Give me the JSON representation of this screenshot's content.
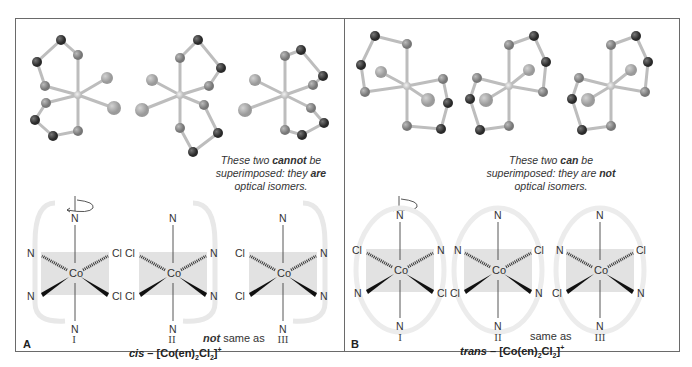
{
  "figure": {
    "panels": [
      {
        "letter": "A",
        "note_line1_pre": "These two ",
        "note_line1_bold": "cannot",
        "note_line1_post": " be",
        "note_line2_pre": "superimposed: they ",
        "note_line2_bold": "are",
        "note_line2_post": "",
        "note_line3": "optical isomers.",
        "numerals": [
          "I",
          "II",
          "III"
        ],
        "relation_bold": "not",
        "relation_text": " same as",
        "formula_prefix": "cis",
        "formula_dash": " – [Co(en)",
        "formula_sub1": "2",
        "formula_mid": "Cl",
        "formula_sub2": "2",
        "formula_end": "]",
        "formula_sup": "+",
        "structures": [
          {
            "top": "N",
            "upper_left": "N",
            "upper_right": "Cl",
            "lower_left": "N",
            "lower_right": "Cl",
            "bottom": "N",
            "center": "Co"
          },
          {
            "top": "N",
            "upper_left": "Cl",
            "upper_right": "N",
            "lower_left": "Cl",
            "lower_right": "N",
            "bottom": "N",
            "center": "Co"
          },
          {
            "top": "N",
            "upper_left": "Cl",
            "upper_right": "N",
            "lower_left": "Cl",
            "lower_right": "N",
            "bottom": "N",
            "center": "Co"
          }
        ]
      },
      {
        "letter": "B",
        "note_line1_pre": "These two ",
        "note_line1_bold": "can",
        "note_line1_post": " be",
        "note_line2_pre": "superimposed: they are ",
        "note_line2_bold": "not",
        "note_line2_post": "",
        "note_line3": "optical isomers.",
        "numerals": [
          "I",
          "II",
          "III"
        ],
        "relation_bold": "",
        "relation_text": "same as",
        "formula_prefix": "trans",
        "formula_dash": " – [Co(en)",
        "formula_sub1": "2",
        "formula_mid": "Cl",
        "formula_sub2": "2",
        "formula_end": "]",
        "formula_sup": "+",
        "structures": [
          {
            "top": "N",
            "upper_left": "Cl",
            "upper_right": "N",
            "lower_left": "N",
            "lower_right": "Cl",
            "bottom": "N",
            "center": "Co"
          },
          {
            "top": "N",
            "upper_left": "N",
            "upper_right": "Cl",
            "lower_left": "Cl",
            "lower_right": "N",
            "bottom": "N",
            "center": "Co"
          },
          {
            "top": "N",
            "upper_left": "N",
            "upper_right": "Cl",
            "lower_left": "Cl",
            "lower_right": "N",
            "bottom": "N",
            "center": "Co"
          }
        ]
      }
    ],
    "colors": {
      "frame": "#6a6a6a",
      "cl_atom": "#a9a9a9",
      "n_atom": "#8c8c8c",
      "c_atom": "#3c3c3c",
      "h_atom": "#e8e8e8",
      "co_atom": "#d6d6d6",
      "plane": "#e3e3e3"
    }
  }
}
